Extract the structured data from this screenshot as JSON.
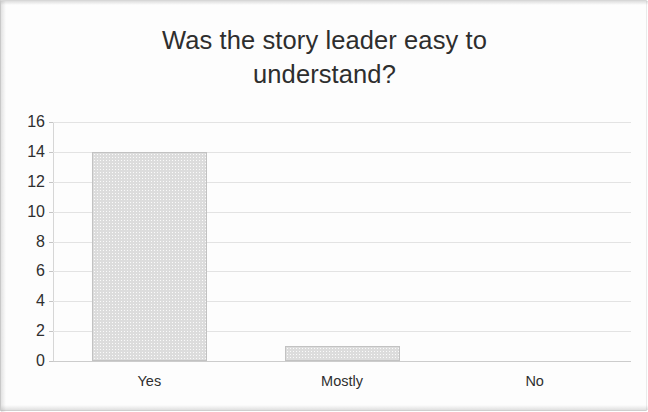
{
  "chart_data": {
    "type": "bar",
    "title": "Was the story leader easy to understand?",
    "title_line1": "Was the story leader easy to",
    "title_line2": "understand?",
    "categories": [
      "Yes",
      "Mostly",
      "No"
    ],
    "values": [
      14,
      1,
      0
    ],
    "series": [
      {
        "name": "Responses",
        "values": [
          14,
          1,
          0
        ]
      }
    ],
    "xlabel": "",
    "ylabel": "",
    "ylim": [
      0,
      16
    ],
    "y_tick_step": 2,
    "y_ticks": [
      "16",
      "14",
      "12",
      "10",
      "8",
      "6",
      "4",
      "2",
      "0"
    ],
    "y_tick_values": [
      16,
      14,
      12,
      10,
      8,
      6,
      4,
      2,
      0
    ],
    "grid": true,
    "grid_axis": "y",
    "legend": false,
    "legend_position": "none",
    "bar_color": "#dcdcdc",
    "bar_border_color": "#c2c2c2",
    "gridline_color": "#e3e3e3",
    "axis_color": "#cccccc",
    "text_color": "#2f2f2f",
    "background_color": "#fdfdfd"
  }
}
